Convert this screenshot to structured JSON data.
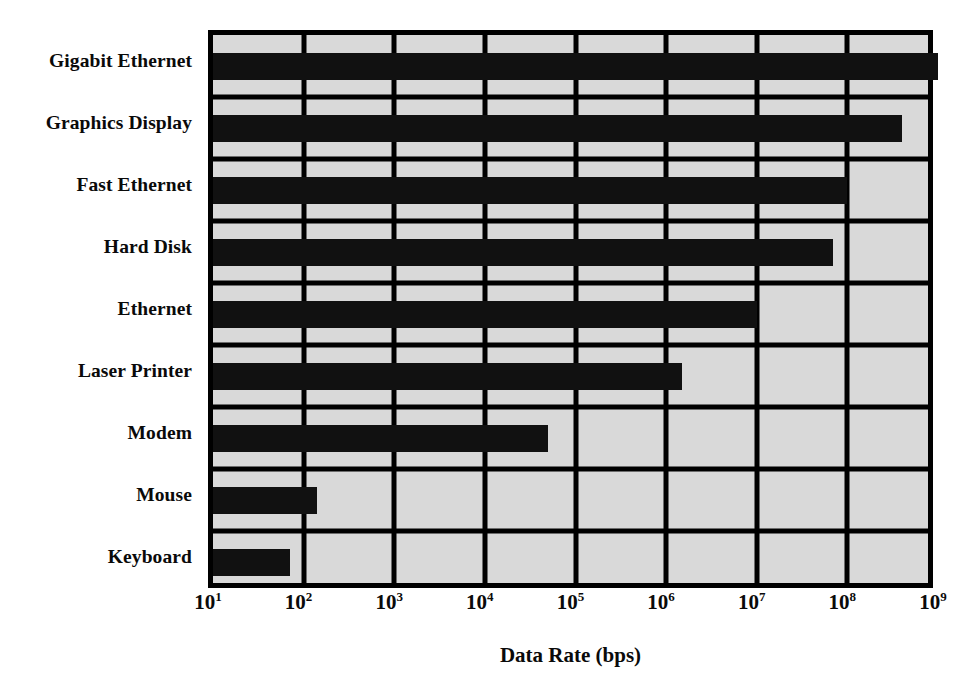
{
  "chart_data": {
    "type": "bar",
    "orientation": "horizontal",
    "title": "",
    "subtitle": "",
    "xlabel": "Data Rate (bps)",
    "ylabel": "",
    "xscale": "log",
    "xlim": [
      10,
      1000000000
    ],
    "grid": true,
    "legend": null,
    "plot_background_color": "#d9d9d9",
    "bar_color": "#111111",
    "frame_color": "#000000",
    "categories": [
      "Gigabit Ethernet",
      "Graphics Display",
      "Fast Ethernet",
      "Hard Disk",
      "Ethernet",
      "Laser Printer",
      "Modem",
      "Mouse",
      "Keyboard"
    ],
    "values": [
      1000000000,
      400000000,
      100000000,
      70000000,
      10000000,
      1500000,
      50000,
      140,
      70
    ],
    "xticks": [
      {
        "label": "10",
        "exponent": "1",
        "value": 10
      },
      {
        "label": "10",
        "exponent": "2",
        "value": 100
      },
      {
        "label": "10",
        "exponent": "3",
        "value": 1000
      },
      {
        "label": "10",
        "exponent": "4",
        "value": 10000
      },
      {
        "label": "10",
        "exponent": "5",
        "value": 100000
      },
      {
        "label": "10",
        "exponent": "6",
        "value": 1000000
      },
      {
        "label": "10",
        "exponent": "7",
        "value": 10000000
      },
      {
        "label": "10",
        "exponent": "8",
        "value": 100000000
      },
      {
        "label": "10",
        "exponent": "9",
        "value": 1000000000
      }
    ]
  }
}
